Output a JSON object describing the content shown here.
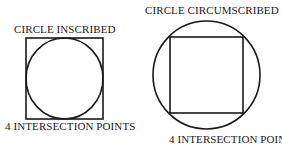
{
  "figure": {
    "background_color": "#ffffff",
    "stroke_color": "#1a1a1a",
    "panels": [
      {
        "id": "inscribed",
        "title": "CIRCLE INSCRIBED",
        "caption": "4 INTERSECTION POINTS",
        "description": "A circle inscribed inside a square, touching each of the four sides at one point.",
        "shapes": {
          "square": {
            "x": 26,
            "y": 38,
            "width": 77,
            "height": 81,
            "stroke_width": 1.6
          },
          "circle": {
            "cx": 64.5,
            "cy": 78.5,
            "rx": 38.5,
            "ry": 40.5,
            "stroke_width": 1.6
          }
        },
        "intersection_points": 4
      },
      {
        "id": "circumscribed",
        "title": "CIRCLE CIRCUMSCRIBED",
        "caption": "4 INTERSECTION POINTS",
        "description": "A circle circumscribed about a square, passing through the four corners of the square.",
        "shapes": {
          "circle": {
            "cx": 206.5,
            "cy": 75,
            "rx": 53.5,
            "ry": 54,
            "stroke_width": 1.6
          },
          "square": {
            "x": 170,
            "y": 37,
            "width": 73,
            "height": 76,
            "stroke_width": 1.6
          }
        },
        "intersection_points": 4
      }
    ]
  }
}
